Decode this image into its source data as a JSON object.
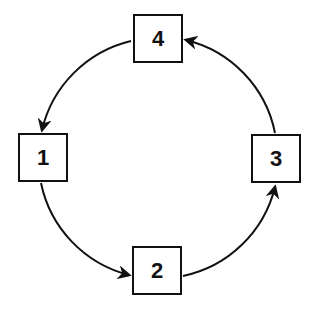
{
  "diagram": {
    "type": "cycle",
    "nodes": [
      {
        "id": "1",
        "label": "1",
        "position": "left"
      },
      {
        "id": "2",
        "label": "2",
        "position": "bottom"
      },
      {
        "id": "3",
        "label": "3",
        "position": "right"
      },
      {
        "id": "4",
        "label": "4",
        "position": "top"
      }
    ],
    "edges": [
      {
        "from": "4",
        "to": "1"
      },
      {
        "from": "1",
        "to": "2"
      },
      {
        "from": "2",
        "to": "3"
      },
      {
        "from": "3",
        "to": "4"
      }
    ],
    "direction": "counterclockwise",
    "colors": {
      "stroke": "#111111",
      "background": "#ffffff"
    }
  }
}
